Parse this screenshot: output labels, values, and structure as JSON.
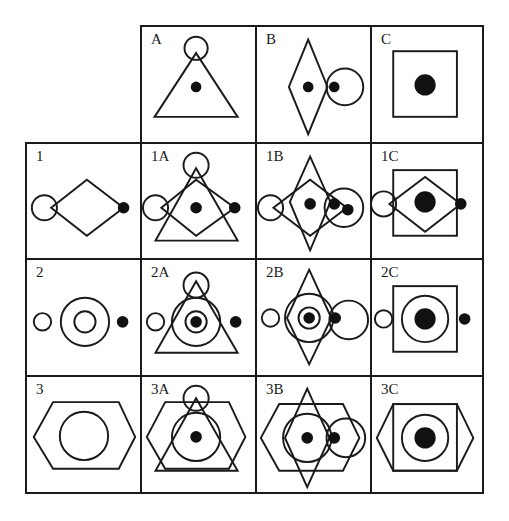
{
  "figure": {
    "type": "shape-combination-matrix",
    "column_headers": [
      {
        "label": "A",
        "description": "triangle with small circle at apex and centered dot"
      },
      {
        "label": "B",
        "description": "vertical diamond with centered dot, large circle on right with dot at its left edge"
      },
      {
        "label": "C",
        "description": "square with large centered dot"
      }
    ],
    "row_headers": [
      {
        "label": "1",
        "description": "horizontal diamond with small circle at left vertex and dot at right vertex"
      },
      {
        "label": "2",
        "description": "small circle left, concentric circles center, dot right"
      },
      {
        "label": "3",
        "description": "hexagon with inscribed circle"
      }
    ],
    "cells": {
      "A": "A",
      "B": "B",
      "C": "C",
      "1": "1",
      "1A": "1A",
      "1B": "1B",
      "1C": "1C",
      "2": "2",
      "2A": "2A",
      "2B": "2B",
      "2C": "2C",
      "3": "3",
      "3A": "3A",
      "3B": "3B",
      "3C": "3C"
    },
    "colors": {
      "stroke": "#1a1a1a",
      "fill": "#111111",
      "background": "#ffffff"
    }
  }
}
